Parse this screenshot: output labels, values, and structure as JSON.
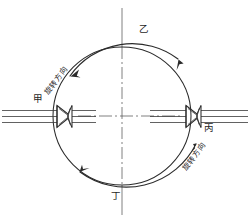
{
  "figure": {
    "stations": {
      "top_label": "乙",
      "bottom_label": "丁",
      "left_label": "甲",
      "right_label": "丙"
    },
    "annotations": {
      "left_direction_text": "旋转方向",
      "right_direction_text": "旋转方向"
    },
    "colors": {
      "line": "#2b2b2b",
      "thin_line": "#3a3a3a",
      "center_line": "#555555",
      "background": "#ffffff",
      "text": "#1f1f1f"
    },
    "geometry": {
      "circle_center_x": 122,
      "circle_center_y": 116,
      "circle_radius": 69,
      "vertical_axis_top": 8,
      "vertical_axis_bottom": 215,
      "horizontal_axis_y": 116
    }
  }
}
